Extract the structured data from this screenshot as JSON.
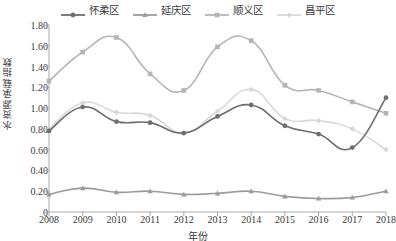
{
  "chart_data": {
    "type": "line",
    "title": "",
    "xlabel": "年份",
    "ylabel": "水资源承载指数",
    "x": [
      2008,
      2009,
      2010,
      2011,
      2012,
      2013,
      2014,
      2015,
      2016,
      2017,
      2018
    ],
    "categories": [
      "2008",
      "2009",
      "2010",
      "2011",
      "2012",
      "2013",
      "2014",
      "2015",
      "2016",
      "2017",
      "2018"
    ],
    "ylim": [
      0,
      1.8
    ],
    "yticks": [
      "0",
      "0.20",
      "0.40",
      "0.60",
      "0.80",
      "1.00",
      "1.20",
      "1.40",
      "1.60",
      "1.80"
    ],
    "ytick_values": [
      0,
      0.2,
      0.4,
      0.6,
      0.8,
      1.0,
      1.2,
      1.4,
      1.6,
      1.8
    ],
    "grid": false,
    "legend_position": "top-center",
    "series": [
      {
        "name": "怀柔区",
        "color": "#6e6e6e",
        "marker": "circle",
        "values": [
          0.78,
          1.01,
          0.87,
          0.86,
          0.76,
          0.92,
          1.03,
          0.83,
          0.75,
          0.62,
          1.1
        ]
      },
      {
        "name": "延庆区",
        "color": "#9b9b9b",
        "marker": "triangle",
        "values": [
          0.17,
          0.23,
          0.19,
          0.2,
          0.17,
          0.18,
          0.2,
          0.15,
          0.13,
          0.14,
          0.2
        ]
      },
      {
        "name": "顺义区",
        "color": "#b5b5b5",
        "marker": "square",
        "values": [
          1.26,
          1.54,
          1.68,
          1.33,
          1.17,
          1.59,
          1.65,
          1.22,
          1.17,
          1.06,
          0.95
        ]
      },
      {
        "name": "昌平区",
        "color": "#d8d8d8",
        "marker": "diamond",
        "values": [
          0.8,
          1.05,
          0.96,
          0.93,
          0.76,
          0.97,
          1.18,
          0.9,
          0.88,
          0.8,
          0.6
        ]
      }
    ]
  },
  "axis": {
    "y_title": "水资源承载指数",
    "x_title": "年份",
    "y_labels": [
      "1.80",
      "1.60",
      "1.40",
      "1.20",
      "1.00",
      "0.80",
      "0.60",
      "0.40",
      "0.20",
      "0"
    ],
    "x_labels": [
      "2008",
      "2009",
      "2010",
      "2011",
      "2012",
      "2013",
      "2014",
      "2015",
      "2016",
      "2017",
      "2018"
    ]
  },
  "legend": {
    "items": [
      {
        "label": "怀柔区"
      },
      {
        "label": "延庆区"
      },
      {
        "label": "顺义区"
      },
      {
        "label": "昌平区"
      }
    ]
  },
  "colors": {
    "series_1": "#6e6e6e",
    "series_2": "#9b9b9b",
    "series_3": "#b5b5b5",
    "series_4": "#d8d8d8",
    "axis": "#a8a8a8",
    "text": "#3b3b3b"
  }
}
